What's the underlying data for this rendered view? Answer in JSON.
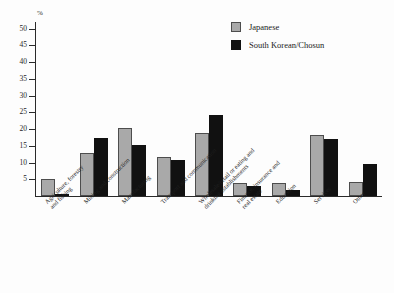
{
  "chart_data": {
    "type": "bar",
    "title": "",
    "xlabel": "",
    "ylabel": "%",
    "ylim": [
      0,
      52
    ],
    "yticks": [
      5,
      10,
      15,
      20,
      25,
      30,
      35,
      40,
      45,
      50
    ],
    "grid": false,
    "legend_position": "top-right",
    "categories": [
      "Agriculture, forestry\nand fishing",
      "Mining and construction",
      "Manufacturing",
      "Transport and communication",
      "Wholesale/retail or eating and\ndrinking establishments",
      "Finance, insurance and\nreal estate",
      "Education",
      "Services",
      "Other"
    ],
    "series": [
      {
        "name": "Japanese",
        "color": "#a9a9a9",
        "values": [
          5.0,
          13.0,
          20.3,
          11.6,
          18.8,
          3.9,
          3.9,
          18.1,
          4.2
        ]
      },
      {
        "name": "South Korean/Chosun",
        "color": "#111111",
        "values": [
          0.7,
          17.2,
          15.2,
          10.7,
          24.2,
          3.0,
          1.9,
          17.1,
          9.7
        ]
      }
    ]
  },
  "legend": {
    "items": [
      {
        "label": "Japanese"
      },
      {
        "label": "South Korean/Chosun"
      }
    ]
  },
  "axis": {
    "unit": "%"
  }
}
